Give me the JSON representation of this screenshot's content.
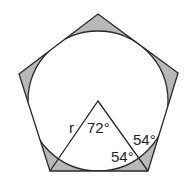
{
  "diagram": {
    "type": "pentagon-with-inscribed-circle",
    "colors": {
      "stroke": "#2a2a2a",
      "shaded": "#b8b8b8",
      "background": "#ffffff"
    },
    "pentagon": {
      "vertices": [
        [
          98,
          14
        ],
        [
          178,
          73
        ],
        [
          148,
          171
        ],
        [
          50,
          171
        ],
        [
          19,
          74
        ]
      ]
    },
    "circle": {
      "cx": 98,
      "cy": 101,
      "r": 70
    },
    "triangle": {
      "apex": [
        98,
        101
      ],
      "base_left": [
        50,
        171
      ],
      "base_right": [
        148,
        171
      ]
    },
    "labels": {
      "radius": "r",
      "apex_angle": "72°",
      "base_angle_inner": "54°",
      "base_angle_outer": "54°"
    }
  }
}
